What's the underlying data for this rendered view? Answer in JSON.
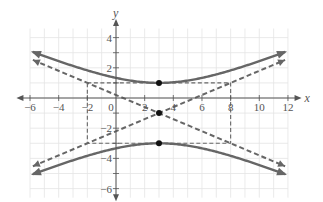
{
  "chart_data": {
    "type": "line",
    "title": "",
    "xlabel": "x",
    "ylabel": "y",
    "xlim": [
      -6,
      12
    ],
    "ylim": [
      -6,
      4
    ],
    "grid": true,
    "x_ticks": [
      -6,
      -4,
      -2,
      0,
      2,
      4,
      6,
      8,
      10,
      12
    ],
    "x_tick_labels": [
      "−6",
      "−4",
      "−2",
      "0",
      "2",
      "4",
      "6",
      "8",
      "10",
      "12"
    ],
    "y_ticks": [
      -6,
      -4,
      -2,
      2,
      4
    ],
    "y_tick_labels": [
      "−6",
      "−4",
      "−2",
      "2",
      "4"
    ],
    "hyperbola": {
      "equation": "(y+1)^2/4 - (x-3)^2/25 = 1",
      "center": [
        3,
        -1
      ],
      "a": 2,
      "b": 5,
      "orientation": "vertical",
      "color": "#666666"
    },
    "asymptotes": [
      {
        "name": "asymptote-1",
        "equation": "y + 1 = (2/5)(x - 3)",
        "slope": 0.4,
        "style": "dashed"
      },
      {
        "name": "asymptote-2",
        "equation": "y + 1 = -(2/5)(x - 3)",
        "slope": -0.4,
        "style": "dashed"
      }
    ],
    "fundamental_rectangle": {
      "x": [
        -2,
        8
      ],
      "y": [
        -3,
        1
      ],
      "style": "dashed"
    },
    "points": [
      {
        "label": "center",
        "x": 3,
        "y": -1
      },
      {
        "label": "upper-vertex",
        "x": 3,
        "y": 1
      },
      {
        "label": "lower-vertex",
        "x": 3,
        "y": -3
      }
    ],
    "series": [
      {
        "name": "upper-branch",
        "x": [
          -6,
          -4,
          -2,
          0,
          2,
          3,
          4,
          6,
          8,
          10,
          12
        ],
        "y": [
          2.98,
          2.42,
          1.83,
          1.33,
          1.04,
          1.0,
          1.04,
          1.33,
          1.83,
          2.42,
          2.98
        ]
      },
      {
        "name": "lower-branch",
        "x": [
          -6,
          -4,
          -2,
          0,
          2,
          3,
          4,
          6,
          8,
          10,
          12
        ],
        "y": [
          -4.98,
          -4.42,
          -3.83,
          -3.33,
          -3.04,
          -3.0,
          -3.04,
          -3.33,
          -3.83,
          -4.42,
          -4.98
        ]
      }
    ]
  }
}
